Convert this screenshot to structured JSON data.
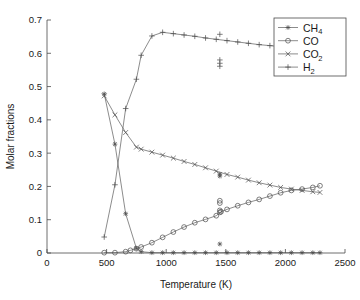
{
  "chart_data": {
    "type": "line",
    "title": "",
    "xlabel": "Temperature (K)",
    "ylabel": "Molar fractions",
    "xlim": [
      0,
      2500
    ],
    "ylim": [
      0,
      0.7
    ],
    "xticks": [
      "0",
      "500",
      "1000",
      "1500",
      "2000",
      "2500"
    ],
    "xtick_values": [
      0,
      500,
      1000,
      1500,
      2000,
      2500
    ],
    "yticks": [
      "0",
      "0.1",
      "0.2",
      "0.3",
      "0.4",
      "0.5",
      "0.6",
      "0.7"
    ],
    "ytick_values": [
      0,
      0.1,
      0.2,
      0.3,
      0.4,
      0.5,
      0.6,
      0.7
    ],
    "grid": false,
    "legend_position": "top-right",
    "series": [
      {
        "name": "CH4",
        "legend_label": "CH",
        "legend_subscript": "4",
        "marker": "star",
        "x": [
          480,
          570,
          660,
          750,
          790,
          880,
          970,
          1060,
          1150,
          1240,
          1330,
          1420,
          1510,
          1600,
          1690,
          1780,
          1870,
          1960,
          2050,
          2140,
          2230,
          2290
        ],
        "y": [
          0.478,
          0.327,
          0.118,
          0.014,
          0.004,
          0.001,
          0.001,
          0.001,
          0.001,
          0.001,
          0.001,
          0.001,
          0.001,
          0.001,
          0.001,
          0.001,
          0.001,
          0.001,
          0.001,
          0.001,
          0.001,
          0.001
        ]
      },
      {
        "name": "CO",
        "legend_label": "CO",
        "legend_subscript": "",
        "marker": "circle",
        "x": [
          480,
          570,
          660,
          700,
          750,
          790,
          880,
          970,
          1060,
          1150,
          1240,
          1330,
          1420,
          1460,
          1510,
          1600,
          1690,
          1780,
          1870,
          1960,
          2050,
          2140,
          2230,
          2290
        ],
        "y": [
          0.001,
          0.001,
          0.004,
          0.008,
          0.013,
          0.018,
          0.031,
          0.047,
          0.063,
          0.078,
          0.091,
          0.101,
          0.112,
          0.124,
          0.131,
          0.142,
          0.152,
          0.161,
          0.171,
          0.181,
          0.188,
          0.192,
          0.197,
          0.202
        ]
      },
      {
        "name": "CO2",
        "legend_label": "CO",
        "legend_subscript": "2",
        "marker": "x",
        "x": [
          480,
          570,
          660,
          750,
          790,
          880,
          970,
          1060,
          1150,
          1240,
          1330,
          1420,
          1510,
          1600,
          1690,
          1780,
          1870,
          1960,
          2050,
          2140,
          2230,
          2290
        ],
        "y": [
          0.472,
          0.415,
          0.362,
          0.318,
          0.312,
          0.303,
          0.294,
          0.285,
          0.275,
          0.266,
          0.256,
          0.246,
          0.236,
          0.228,
          0.219,
          0.211,
          0.204,
          0.197,
          0.192,
          0.188,
          0.184,
          0.182
        ]
      },
      {
        "name": "H2",
        "legend_label": "H",
        "legend_subscript": "2",
        "marker": "plus",
        "x": [
          480,
          570,
          660,
          750,
          790,
          880,
          970,
          1060,
          1150,
          1240,
          1330,
          1420,
          1510,
          1600,
          1690,
          1780,
          1870,
          1960,
          2050,
          2140,
          2230,
          2290
        ],
        "y": [
          0.048,
          0.205,
          0.434,
          0.522,
          0.594,
          0.652,
          0.663,
          0.659,
          0.655,
          0.651,
          0.646,
          0.642,
          0.638,
          0.634,
          0.63,
          0.626,
          0.623,
          0.62,
          0.617,
          0.614,
          0.612,
          0.61
        ]
      }
    ],
    "outliers": [
      {
        "series": "H2",
        "marker": "plus",
        "x": 1450,
        "y": 0.657
      },
      {
        "series": "H2",
        "marker": "plus",
        "x": 1450,
        "y": 0.58
      },
      {
        "series": "H2",
        "marker": "plus",
        "x": 1450,
        "y": 0.57
      },
      {
        "series": "H2",
        "marker": "plus",
        "x": 1450,
        "y": 0.561
      },
      {
        "series": "CO2",
        "marker": "star",
        "x": 1450,
        "y": 0.237
      },
      {
        "series": "CO2",
        "marker": "star",
        "x": 1450,
        "y": 0.231
      },
      {
        "series": "CO",
        "marker": "circle",
        "x": 1450,
        "y": 0.157
      },
      {
        "series": "CO",
        "marker": "circle",
        "x": 1450,
        "y": 0.15
      },
      {
        "series": "CO",
        "marker": "circle",
        "x": 1450,
        "y": 0.128
      },
      {
        "series": "CO",
        "marker": "circle",
        "x": 1450,
        "y": 0.122
      },
      {
        "series": "CH4",
        "marker": "star",
        "x": 1450,
        "y": 0.027
      }
    ],
    "colors": {
      "line": "#5a5a5a",
      "axis": "#4a4a4a",
      "text": "#1a1a1a",
      "background": "#ffffff"
    }
  }
}
